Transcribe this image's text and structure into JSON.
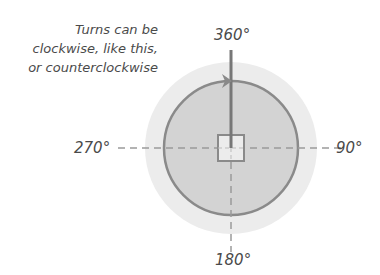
{
  "annotation": {
    "lines": [
      "Turns can be",
      "clockwise, like this,",
      "or counterclockwise"
    ]
  },
  "labels": {
    "top": "360°",
    "right": "90°",
    "bottom": "180°",
    "left": "270°"
  },
  "colors": {
    "outer_circle": "#ececec",
    "inner_circle": "#d2d2d2",
    "stroke": "#8a8a8a",
    "pointer": "#777777",
    "text": "#4a4a4a"
  }
}
